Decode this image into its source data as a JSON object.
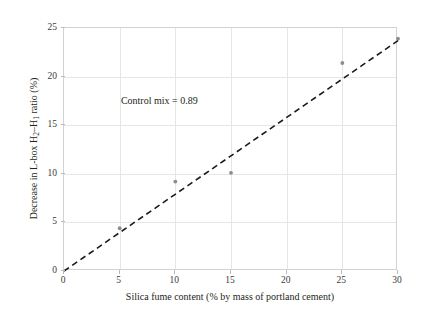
{
  "chart_data": {
    "type": "scatter",
    "title": "",
    "xlabel": "Silica fume content (% by mass of portland cement)",
    "ylabel": "Decrease in L-box H2–H1 ratio (%)",
    "ylabel_parts": {
      "prefix": "Decrease in L-box H",
      "sub1": "2",
      "mid": "–H",
      "sub2": "1",
      "suffix": " ratio (%)"
    },
    "xlim": [
      0,
      30
    ],
    "ylim": [
      0,
      25
    ],
    "xticks": [
      0,
      5,
      10,
      15,
      20,
      25,
      30
    ],
    "yticks": [
      0,
      5,
      10,
      15,
      20,
      25
    ],
    "xtick_labels": [
      "0",
      "5",
      "10",
      "15",
      "20",
      "25",
      "30"
    ],
    "ytick_labels": [
      "0",
      "5",
      "10",
      "15",
      "20",
      "25"
    ],
    "grid": true,
    "legend": "none",
    "series": [
      {
        "name": "measured-points",
        "kind": "scatter",
        "marker": "circle",
        "color": "#8c8c8c",
        "points": [
          {
            "x": 5,
            "y": 4.4
          },
          {
            "x": 10,
            "y": 9.2
          },
          {
            "x": 15,
            "y": 10.1
          },
          {
            "x": 25,
            "y": 21.4
          },
          {
            "x": 30,
            "y": 23.9
          }
        ]
      },
      {
        "name": "trend-line",
        "kind": "line",
        "style": "dashed",
        "color": "#1a1a1a",
        "points": [
          {
            "x": 0,
            "y": 0
          },
          {
            "x": 30,
            "y": 23.7
          }
        ]
      }
    ],
    "annotations": [
      {
        "name": "control-mix-note",
        "text": "Control mix = 0.89",
        "x": 5.2,
        "y": 17.4
      }
    ],
    "colors": {
      "background": "#ffffff",
      "frame": "#d2d2d2",
      "grid": "#e6e6e6",
      "marker": "#8c8c8c",
      "trend": "#1a1a1a",
      "text": "#231f20"
    }
  }
}
